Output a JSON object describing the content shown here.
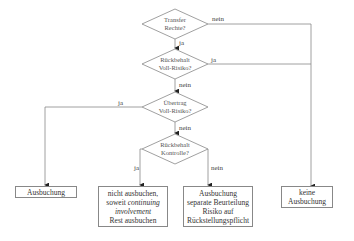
{
  "decisions": [
    {
      "id": "transfer",
      "line1": "Transfer",
      "line2": "Rechte?",
      "yes": "ja",
      "no": "nein"
    },
    {
      "id": "rueckbehalt-voll",
      "line1": "Rückbehalt",
      "line2": "Voll-Risiko?",
      "yes": "ja",
      "no": "nein"
    },
    {
      "id": "uebertrag-voll",
      "line1": "Übertrag",
      "line2": "Voll-Risiko?",
      "yes": "ja",
      "no": "nein"
    },
    {
      "id": "rueckbehalt-kontrolle",
      "line1": "Rückbehalt",
      "line2": "Kontrolle?",
      "yes": "ja",
      "no": "nein"
    }
  ],
  "outcomes": {
    "ausbuchung": {
      "line1": "Ausbuchung"
    },
    "teilweise": {
      "line1": "nicht ausbuchen,",
      "line2a": "soweit ",
      "line2b": "continuing",
      "line3": "involvement",
      "line4": "Rest ausbuchen"
    },
    "separat": {
      "line1": "Ausbuchung",
      "line2": "separate Beurteilung",
      "line3": "Risiko auf",
      "line4": "Rückstellungspflicht"
    },
    "keine": {
      "line1": "keine",
      "line2": "Ausbuchung"
    }
  }
}
